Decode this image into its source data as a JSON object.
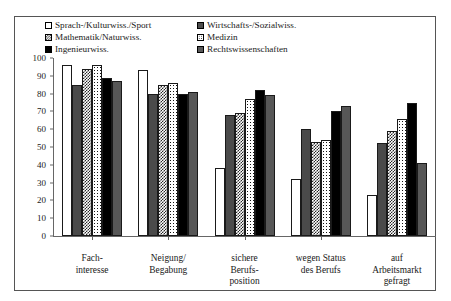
{
  "chart_data": {
    "type": "bar",
    "title": "",
    "subtitle": "",
    "xlabel": "",
    "ylabel": "",
    "ylim": [
      0,
      100
    ],
    "ytick_step": 10,
    "grid": false,
    "legend_position": "top",
    "yticks": [
      "100",
      "90",
      "80",
      "70",
      "60",
      "50",
      "40",
      "30",
      "20",
      "10",
      "0"
    ],
    "categories": [
      "Fach-\ninteresse",
      "Neigung/\nBegabung",
      "sichere\nBerufs-\nposition",
      "wegen Status\ndes Berufs",
      "auf\nArbeitsmarkt\ngefragt"
    ],
    "category_lines": [
      [
        "Fach-",
        "interesse"
      ],
      [
        "Neigung/",
        "Begabung"
      ],
      [
        "sichere",
        "Berufs-",
        "position"
      ],
      [
        "wegen Status",
        "des Berufs"
      ],
      [
        "auf",
        "Arbeitsmarkt",
        "gefragt"
      ]
    ],
    "series": [
      {
        "name": "Sprach-/Kulturwiss./Sport",
        "pattern": "white-outline",
        "values": [
          96,
          93,
          38,
          32,
          23
        ]
      },
      {
        "name": "Wirtschafts-/Sozialwiss.",
        "pattern": "dark-gray-solid",
        "values": [
          85,
          80,
          68,
          60,
          52
        ]
      },
      {
        "name": "Mathematik/Naturwiss.",
        "pattern": "checkered",
        "values": [
          94,
          85,
          69,
          53,
          59
        ]
      },
      {
        "name": "Medizin",
        "pattern": "dotted",
        "values": [
          96,
          86,
          77,
          54,
          66
        ]
      },
      {
        "name": "Ingenieurwiss.",
        "pattern": "black-solid",
        "values": [
          89,
          80,
          82,
          70,
          75
        ]
      },
      {
        "name": "Rechtswissenschaften",
        "pattern": "medium-gray-solid",
        "values": [
          87,
          81,
          79,
          73,
          41
        ]
      }
    ]
  },
  "legend": {
    "items": [
      {
        "label": "Sprach-/Kulturwiss./Sport"
      },
      {
        "label": "Wirtschafts-/Sozialwiss."
      },
      {
        "label": "Mathematik/Naturwiss."
      },
      {
        "label": "Medizin"
      },
      {
        "label": "Ingenieurwiss."
      },
      {
        "label": "Rechtswissenschaften"
      }
    ]
  },
  "colors": {
    "white": "#ffffff",
    "dark_gray": "#4a4a4a",
    "checkered": "#262626",
    "dotted": "#141414",
    "black": "#000000",
    "medium_gray": "#575757",
    "axis": "#666666",
    "frame": "#555555"
  }
}
